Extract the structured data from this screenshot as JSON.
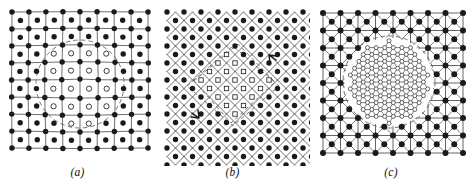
{
  "figure": {
    "kind": "scientific-figure",
    "background_color": "#ffffff",
    "ink_color": "#1a1a1a",
    "line_color": "#555555",
    "dashed_color": "#666666"
  },
  "panels": [
    {
      "id": "a",
      "label": "(a)",
      "lattice_type": "square",
      "lattice": {
        "cols": 8,
        "rows": 8,
        "spacing": 17.0,
        "origin_x": 12.0,
        "origin_y": 12.0,
        "has_cell_center_atoms": true,
        "has_diagonals": false,
        "distortion": 1.35
      },
      "inclusion": {
        "shape": "circle",
        "boundary_style": "dashed",
        "center_x": 80.0,
        "center_y": 84.0,
        "radius": 44.0,
        "marker": "open-circle",
        "marker_radius": 2.6,
        "count": 12
      },
      "node_marker": "filled-dot",
      "node_radius": 2.7
    },
    {
      "id": "b",
      "label": "(b)",
      "lattice_type": "diamond",
      "lattice": {
        "cols": 9,
        "rows": 9,
        "spacing": 17.0,
        "origin_x": 12.0,
        "origin_y": 12.0,
        "rotation_deg": 45,
        "has_cell_center_atoms": false,
        "has_diagonals": false,
        "distortion": 0.0
      },
      "inclusion": {
        "shape": "rhombus",
        "boundary_style": "dashed",
        "center_x": 78.0,
        "center_y": 86.0,
        "half_width": 46.0,
        "half_height": 40.0,
        "marker": "open-square",
        "marker_size": 4.4,
        "count": 13
      },
      "node_marker": "filled-dot",
      "node_radius": 2.7
    },
    {
      "id": "c",
      "label": "(c)",
      "lattice_type": "square-with-diagonals",
      "lattice": {
        "cols": 8,
        "rows": 8,
        "spacing": 17.5,
        "origin_x": 13.0,
        "origin_y": 13.0,
        "has_cell_center_atoms": true,
        "has_diagonals": true,
        "distortion": 0.0
      },
      "inclusion": {
        "shape": "circle",
        "boundary_style": "dashed",
        "center_x": 79.0,
        "center_y": 82.0,
        "radius": 46.0,
        "marker": "open-circle-fine-mesh",
        "marker_radius": 2.0,
        "mesh_type": "hexagonal",
        "mesh_spacing": 8.6,
        "count": 61
      },
      "node_marker": "filled-dot",
      "node_radius": 3.0
    }
  ]
}
